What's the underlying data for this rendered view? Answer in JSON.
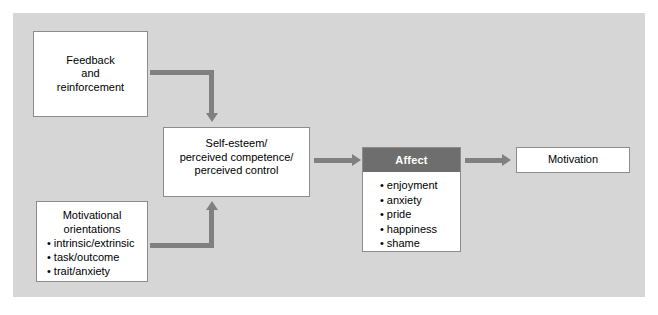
{
  "figure": {
    "type": "flow-diagram",
    "background_color": "#d6d6d6",
    "accent_color": "#808080",
    "header_color": "#6e6e6e",
    "box_border_color": "#8c8c8c"
  },
  "boxes": {
    "feedback": {
      "name": "Feedback and reinforcement",
      "lines": [
        "Feedback",
        "and",
        "reinforcement"
      ]
    },
    "self_esteem": {
      "name": "Self-esteem / perceived competence / perceived control",
      "lines": [
        "Self-esteem/",
        "perceived competence/",
        "perceived control"
      ]
    },
    "motivational_orientations": {
      "title_lines": [
        "Motivational",
        "orientations"
      ],
      "items": [
        "intrinsic/extrinsic",
        "task/outcome",
        "trait/anxiety"
      ]
    },
    "affect": {
      "header": "Affect",
      "items": [
        "enjoyment",
        "anxiety",
        "pride",
        "happiness",
        "shame"
      ]
    },
    "motivation": {
      "label": "Motivation"
    }
  },
  "bullet": "•",
  "connectors": [
    {
      "id": "feedback-to-self-esteem",
      "from": "feedback",
      "to": "self_esteem",
      "shape": "elbow-right-down"
    },
    {
      "id": "motivational-orientations-to-self-esteem",
      "from": "motivational_orientations",
      "to": "self_esteem",
      "shape": "elbow-right-up"
    },
    {
      "id": "self-esteem-to-affect",
      "from": "self_esteem",
      "to": "affect",
      "shape": "straight-right"
    },
    {
      "id": "affect-to-motivation",
      "from": "affect",
      "to": "motivation",
      "shape": "straight-right"
    }
  ]
}
